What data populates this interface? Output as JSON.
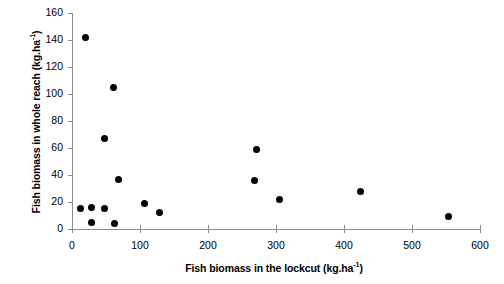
{
  "chart_data": {
    "type": "scatter",
    "title": "",
    "xlabel": "Fish biomass in the lockcut (kg.ha-1)",
    "xlabel_main": "Fish biomass in the lockcut (kg.ha",
    "xlabel_sup": "-1",
    "xlabel_tail": ")",
    "ylabel": "Fish biomass in whole reach (kg.ha-1)",
    "ylabel_main": "Fish biomass in whole reach (kg.ha",
    "ylabel_sup": "-1",
    "ylabel_tail": ")",
    "xlim": [
      0,
      600
    ],
    "ylim": [
      0,
      160
    ],
    "xticks": [
      0,
      100,
      200,
      300,
      400,
      500,
      600
    ],
    "yticks": [
      0,
      20,
      40,
      60,
      80,
      100,
      120,
      140,
      160
    ],
    "xtick_labels": [
      "0",
      "100",
      "200",
      "300",
      "400",
      "500",
      "600"
    ],
    "ytick_labels": [
      "0",
      "20",
      "40",
      "60",
      "80",
      "100",
      "120",
      "140",
      "160"
    ],
    "grid": false,
    "legend": "none",
    "marker": "filled-circle",
    "marker_color": "#000000",
    "axis_color": "#8c8c8c",
    "points": [
      {
        "x": 20,
        "y": 142
      },
      {
        "x": 61,
        "y": 105
      },
      {
        "x": 48,
        "y": 67
      },
      {
        "x": 68,
        "y": 37
      },
      {
        "x": 13,
        "y": 15
      },
      {
        "x": 28,
        "y": 16
      },
      {
        "x": 48,
        "y": 15
      },
      {
        "x": 28,
        "y": 5
      },
      {
        "x": 62,
        "y": 4
      },
      {
        "x": 106,
        "y": 19
      },
      {
        "x": 128,
        "y": 12
      },
      {
        "x": 271,
        "y": 59
      },
      {
        "x": 268,
        "y": 36
      },
      {
        "x": 305,
        "y": 22
      },
      {
        "x": 424,
        "y": 28
      },
      {
        "x": 553,
        "y": 9
      }
    ]
  }
}
